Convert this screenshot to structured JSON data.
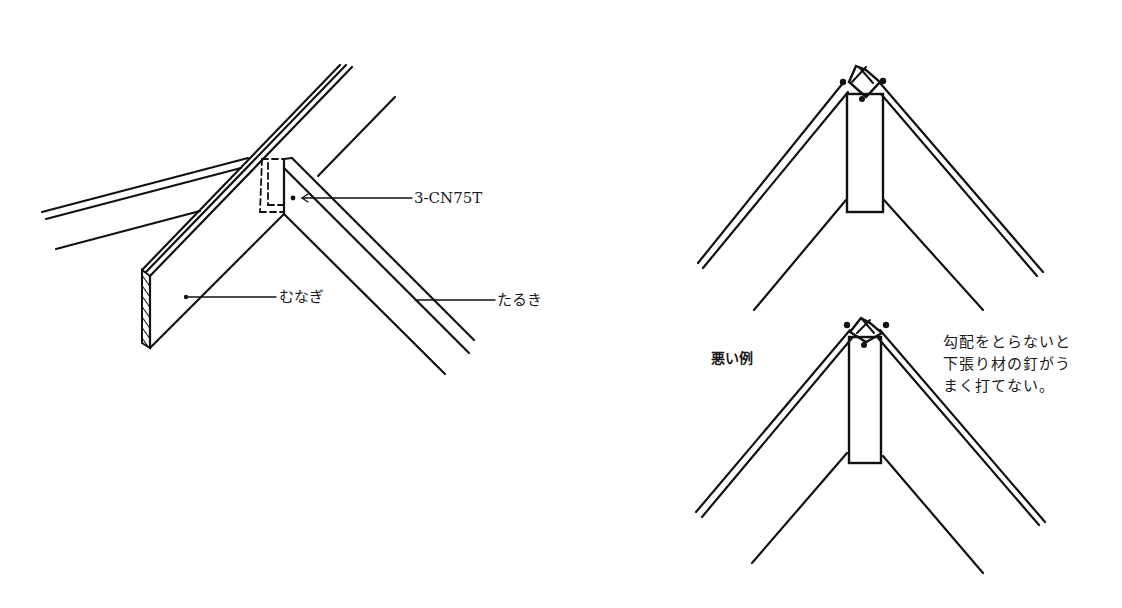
{
  "left_figure": {
    "labels": {
      "nail_spec": "3-CN75T",
      "ridge_beam": "むなぎ",
      "rafter": "たるき"
    }
  },
  "right_figure": {
    "bad_example_label": "悪い例",
    "note_lines": [
      "勾配をとらないと",
      "下張り材の釘がう",
      "まく打てない。"
    ]
  },
  "colors": {
    "line": "#111111",
    "background": "#ffffff"
  }
}
